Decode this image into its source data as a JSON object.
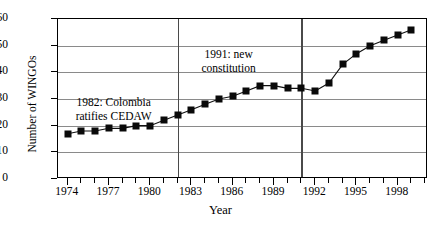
{
  "chart_data": {
    "type": "line",
    "title": "",
    "xlabel": "Year",
    "ylabel": "Number of WINGOs",
    "xlim": [
      1973.3,
      2000.2
    ],
    "ylim": [
      0,
      60
    ],
    "ytick_values": [
      0,
      10,
      20,
      30,
      40,
      50,
      60
    ],
    "ytick_labels": [
      "0",
      "10",
      "20",
      "30",
      "40",
      "50",
      "60"
    ],
    "xtick_major_values": [
      1974,
      1977,
      1980,
      1983,
      1986,
      1989,
      1992,
      1995,
      1998
    ],
    "xtick_major_labels": [
      "1974",
      "1977",
      "1980",
      "1983",
      "1986",
      "1989",
      "1992",
      "1995",
      "1998"
    ],
    "xtick_minor_values": [
      1975,
      1976,
      1978,
      1979,
      1981,
      1982,
      1984,
      1985,
      1987,
      1988,
      1990,
      1991,
      1993,
      1994,
      1996,
      1997,
      1999,
      2000
    ],
    "grid": "horizontal",
    "legend": "none",
    "marker": "filled-square",
    "x": [
      1974,
      1975,
      1976,
      1977,
      1978,
      1979,
      1980,
      1981,
      1982,
      1983,
      1984,
      1985,
      1986,
      1987,
      1988,
      1989,
      1990,
      1991,
      1992,
      1993,
      1994,
      1995,
      1996,
      1997,
      1998,
      1999
    ],
    "values": [
      17,
      18,
      18,
      19,
      19,
      20,
      20,
      22,
      24,
      26,
      28,
      30,
      31,
      33,
      35,
      35,
      34,
      34,
      33,
      36,
      43,
      47,
      50,
      52,
      54,
      56
    ],
    "series": [
      {
        "name": "Number of WINGOs",
        "values": [
          17,
          18,
          18,
          19,
          19,
          20,
          20,
          22,
          24,
          26,
          28,
          30,
          31,
          33,
          35,
          35,
          34,
          34,
          33,
          36,
          43,
          47,
          50,
          52,
          54,
          56
        ]
      }
    ],
    "annotations": [
      {
        "text_line1": "1982: Colombia",
        "text_line2": "ratifies CEDAW",
        "x_value": 1982
      },
      {
        "text_line1": "1991: new",
        "text_line2": "constitution",
        "x_value": 1991
      }
    ],
    "vertical_reference_lines": [
      1982,
      1991
    ]
  },
  "colors": {
    "line": "#111111",
    "marker": "#0a0a0a",
    "grid": "#8a8a8a",
    "axis": "#000000",
    "vline": "#4a4a4a",
    "background": "#ffffff"
  },
  "annotation_1": {
    "line1": "1982: Colombia",
    "line2": "ratifies CEDAW"
  },
  "annotation_2": {
    "line1": "1991: new",
    "line2": "constitution"
  },
  "axes": {
    "x_title": "Year",
    "y_title": "Number of WINGOs"
  }
}
